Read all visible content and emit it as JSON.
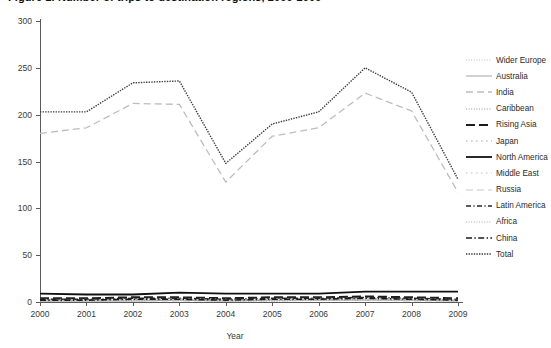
{
  "chart_data": {
    "type": "line",
    "title": "Figure 1. Number of trips to destination regions, 2000-2009",
    "xlabel": "Year",
    "ylabel": "",
    "x": [
      2000,
      2001,
      2002,
      2003,
      2004,
      2005,
      2006,
      2007,
      2008,
      2009
    ],
    "xtick_labels": [
      "2000",
      "2001",
      "2002",
      "2003",
      "2004",
      "2005",
      "2006",
      "2007",
      "2008",
      "2009"
    ],
    "ytick_labels": [
      "0",
      "50",
      "100",
      "150",
      "200",
      "250",
      "300"
    ],
    "yticks": [
      0,
      50,
      100,
      150,
      200,
      250,
      300
    ],
    "ylim": [
      0,
      300
    ],
    "xlim": [
      2000,
      2009
    ],
    "grid": false,
    "legend_position": "right",
    "series": [
      {
        "name": "Wider Europe",
        "style": "dotted",
        "color": "#b4b4b4",
        "width": 0.9,
        "values": [
          2,
          2,
          3,
          3,
          2,
          3,
          3,
          4,
          3,
          2
        ]
      },
      {
        "name": "Australia",
        "style": "solid",
        "color": "#9a9a9a",
        "width": 0.9,
        "values": [
          1,
          1,
          1,
          2,
          1,
          2,
          2,
          2,
          2,
          1
        ]
      },
      {
        "name": "India",
        "style": "dashed",
        "color": "#bdbdbd",
        "width": 1.3,
        "values": [
          180,
          186,
          212,
          211,
          128,
          177,
          186,
          223,
          204,
          117
        ]
      },
      {
        "name": "Caribbean",
        "style": "dotted",
        "color": "#8c8c8c",
        "width": 0.9,
        "values": [
          1,
          1,
          2,
          2,
          1,
          1,
          2,
          2,
          2,
          1
        ]
      },
      {
        "name": "Rising Asia",
        "style": "dashed-thick",
        "color": "#1c1c1c",
        "width": 2.0,
        "values": [
          4,
          4,
          5,
          5,
          4,
          5,
          5,
          6,
          5,
          4
        ]
      },
      {
        "name": "Japan",
        "style": "dotted-sparse",
        "color": "#a8a8a8",
        "width": 1.1,
        "values": [
          3,
          3,
          3,
          4,
          3,
          3,
          4,
          4,
          3,
          3
        ]
      },
      {
        "name": "North America",
        "style": "solid-thick",
        "color": "#111111",
        "width": 1.8,
        "values": [
          9,
          8,
          8,
          10,
          9,
          9,
          9,
          11,
          11,
          11
        ]
      },
      {
        "name": "Middle East",
        "style": "dotted-sparse",
        "color": "#c4c4c4",
        "width": 1.1,
        "values": [
          2,
          2,
          2,
          3,
          2,
          2,
          3,
          3,
          3,
          2
        ]
      },
      {
        "name": "Russia",
        "style": "dashed",
        "color": "#c9c9c9",
        "width": 1.1,
        "values": [
          1,
          1,
          1,
          1,
          1,
          1,
          2,
          2,
          1,
          1
        ]
      },
      {
        "name": "Latin America",
        "style": "dash-dot",
        "color": "#262626",
        "width": 1.4,
        "values": [
          3,
          3,
          4,
          4,
          3,
          4,
          4,
          5,
          4,
          3
        ]
      },
      {
        "name": "Africa",
        "style": "dotted",
        "color": "#9f9f9f",
        "width": 0.9,
        "values": [
          2,
          2,
          2,
          2,
          2,
          2,
          2,
          3,
          2,
          2
        ]
      },
      {
        "name": "China",
        "style": "dash-dot-thick",
        "color": "#1a1a1a",
        "width": 1.6,
        "values": [
          2,
          2,
          3,
          3,
          2,
          3,
          3,
          4,
          3,
          2
        ]
      },
      {
        "name": "Total",
        "style": "dotted-dense",
        "color": "#3d3d3d",
        "width": 1.4,
        "values": [
          203,
          203,
          234,
          236,
          148,
          190,
          203,
          250,
          224,
          131
        ]
      }
    ]
  },
  "legend": {
    "items": [
      {
        "label": "Wider Europe"
      },
      {
        "label": "Australia"
      },
      {
        "label": "India"
      },
      {
        "label": "Caribbean"
      },
      {
        "label": "Rising Asia"
      },
      {
        "label": "Japan"
      },
      {
        "label": "North America"
      },
      {
        "label": "Middle East"
      },
      {
        "label": "Russia"
      },
      {
        "label": "Latin America"
      },
      {
        "label": "Africa"
      },
      {
        "label": "China"
      },
      {
        "label": "Total"
      }
    ]
  }
}
